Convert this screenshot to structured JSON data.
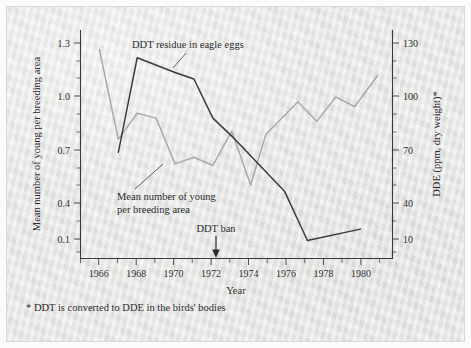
{
  "figure": {
    "background_color": "#e8e8e6",
    "frame_color": "#fbfbfb"
  },
  "axes": {
    "left": {
      "title": "Mean number of young per breeding area",
      "tick_labels": [
        "1.3",
        "1.0",
        "0.7",
        "0.4",
        "0.1"
      ],
      "tick_values": [
        1.3,
        1.0,
        0.7,
        0.4,
        0.1
      ]
    },
    "right": {
      "title": "DDE (ppm, dry weight)*",
      "tick_labels": [
        "130",
        "100",
        "70",
        "40",
        "10"
      ],
      "tick_values": [
        130,
        100,
        70,
        40,
        10
      ]
    },
    "bottom": {
      "title": "Year",
      "tick_labels": [
        "1966",
        "1968",
        "1970",
        "1972",
        "1974",
        "1976",
        "1978",
        "1980"
      ],
      "tick_values": [
        1966,
        1968,
        1970,
        1972,
        1974,
        1976,
        1978,
        1980
      ]
    }
  },
  "annotations": {
    "ddt_residue_label": "DDT residue in eagle eggs",
    "mean_young_label_line1": "Mean number of young",
    "mean_young_label_line2": "per breeding area",
    "ddt_ban_label": "DDT ban"
  },
  "footnote": "* DDT is converted to DDE in the birds' bodies",
  "chart_data": {
    "type": "line",
    "title": "",
    "subtitle": "",
    "xlabel": "Year",
    "ylabel": "Mean number of young per breeding area",
    "y2label": "DDE (ppm, dry weight)*",
    "xlim": [
      1965,
      1981.5
    ],
    "ylim": [
      0.0,
      1.4
    ],
    "y2lim": [
      0,
      140
    ],
    "xticks": [
      1966,
      1968,
      1970,
      1972,
      1974,
      1976,
      1978,
      1980
    ],
    "xticks_minor": [
      1967,
      1969,
      1971,
      1973,
      1975,
      1977,
      1979,
      1981
    ],
    "yticks": [
      0.1,
      0.4,
      0.7,
      1.0,
      1.3
    ],
    "y2ticks": [
      10,
      40,
      70,
      100,
      130
    ],
    "grid": false,
    "legend": "inline annotations",
    "series": [
      {
        "name": "DDT residue in eagle eggs",
        "axis": "right",
        "unit": "ppm, dry weight",
        "color": "#3b3b3b",
        "x": [
          1967,
          1968,
          1970,
          1971,
          1972,
          1973,
          1975.8,
          1977,
          1979.8
        ],
        "values": [
          65,
          123,
          114,
          110,
          86,
          75,
          41,
          11,
          18
        ]
      },
      {
        "name": "Mean number of young per breeding area",
        "axis": "left",
        "unit": "young per breeding area",
        "color": "#a9a9a7",
        "x": [
          1966,
          1967,
          1968,
          1969,
          1970,
          1971,
          1972,
          1973,
          1974,
          1974.8,
          1976.5,
          1977.5,
          1978.5,
          1979.5,
          1980.7
        ],
        "values": [
          1.28,
          0.73,
          0.89,
          0.86,
          0.58,
          0.62,
          0.57,
          0.78,
          0.45,
          0.76,
          0.96,
          0.84,
          0.99,
          0.93,
          1.12
        ]
      }
    ],
    "event_markers": [
      {
        "label": "DDT ban",
        "x": 1972.6
      }
    ],
    "notes": "* DDT is converted to DDE in the birds' bodies"
  }
}
